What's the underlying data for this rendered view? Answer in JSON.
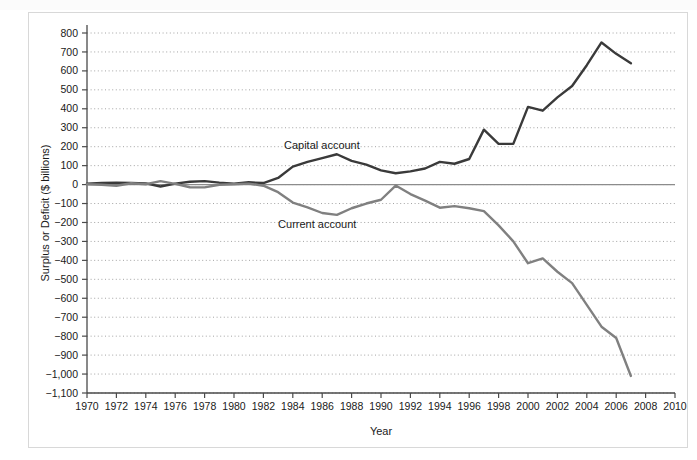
{
  "figure": {
    "y_axis_title": "Surplus or Deficit ($ billions)",
    "x_axis_title": "Year",
    "label_capital": "Capital account",
    "label_current": "Current account",
    "color_capital": "#3a3a3a",
    "color_current": "#808080",
    "color_zero_line": "#8c8c8c",
    "color_grid": "#9a9a9a",
    "color_axis": "#4a4a4a",
    "color_frame": "#d8d8d8"
  },
  "chart_data": {
    "type": "line",
    "title": "",
    "xlabel": "Year",
    "ylabel": "Surplus or Deficit ($ billions)",
    "xlim": [
      1970,
      2010
    ],
    "ylim": [
      -1100,
      800
    ],
    "grid": true,
    "legend": "inline-annotation",
    "xticks": [
      1970,
      1972,
      1974,
      1976,
      1978,
      1980,
      1982,
      1984,
      1986,
      1988,
      1990,
      1992,
      1994,
      1996,
      1998,
      2000,
      2002,
      2004,
      2006,
      2008,
      2010
    ],
    "yticks": [
      800,
      700,
      600,
      500,
      400,
      300,
      200,
      100,
      0,
      -100,
      -200,
      -300,
      -400,
      -500,
      -600,
      -700,
      -800,
      -900,
      -1000,
      -1100
    ],
    "ytick_labels": [
      "800",
      "700",
      "600",
      "500",
      "400",
      "300",
      "200",
      "100",
      "0",
      "−100",
      "−200",
      "−300",
      "−400",
      "−500",
      "−600",
      "−700",
      "−800",
      "−900",
      "−1,000",
      "−1,100"
    ],
    "x": [
      1970,
      1971,
      1972,
      1973,
      1974,
      1975,
      1976,
      1977,
      1978,
      1979,
      1980,
      1981,
      1982,
      1983,
      1984,
      1985,
      1986,
      1987,
      1988,
      1989,
      1990,
      1991,
      1992,
      1993,
      1994,
      1995,
      1996,
      1997,
      1998,
      1999,
      2000,
      2001,
      2002,
      2003,
      2004,
      2005,
      2006,
      2007
    ],
    "series": [
      {
        "name": "Capital account",
        "color": "#3a3a3a",
        "values": [
          5,
          8,
          10,
          8,
          6,
          -10,
          5,
          15,
          18,
          10,
          5,
          12,
          8,
          35,
          95,
          120,
          140,
          160,
          125,
          105,
          75,
          60,
          70,
          85,
          120,
          110,
          135,
          290,
          215,
          215,
          410,
          390,
          460,
          520,
          630,
          750,
          690,
          640
        ]
      },
      {
        "name": "Current account",
        "color": "#808080",
        "values": [
          2,
          -1,
          -6,
          7,
          2,
          18,
          4,
          -14,
          -15,
          -1,
          2,
          5,
          -6,
          -40,
          -95,
          -120,
          -150,
          -160,
          -125,
          -100,
          -80,
          -5,
          -50,
          -85,
          -122,
          -114,
          -125,
          -140,
          -215,
          -300,
          -415,
          -390,
          -460,
          -520,
          -635,
          -750,
          -810,
          -1010
        ]
      }
    ]
  }
}
